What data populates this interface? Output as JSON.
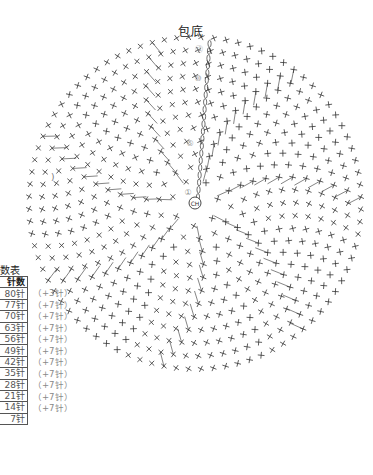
{
  "diagram": {
    "title": "包底",
    "type": "crochet round chart",
    "center_label": "CH",
    "row_markers": [
      "⑫",
      "⑩",
      "⑤",
      "①"
    ],
    "rounds": 12,
    "stray_text": ")"
  },
  "stitch_table": {
    "title": "数表",
    "header": "针数",
    "rows": [
      {
        "count": "80针",
        "increase": "（+3针）"
      },
      {
        "count": "77针",
        "increase": "（+7针）"
      },
      {
        "count": "70针",
        "increase": "（+7针）"
      },
      {
        "count": "63针",
        "increase": "（+7针）"
      },
      {
        "count": "56针",
        "increase": "（+7针）"
      },
      {
        "count": "49针",
        "increase": "（+7针）"
      },
      {
        "count": "42针",
        "increase": "（+7针）"
      },
      {
        "count": "35针",
        "increase": "（+7针）"
      },
      {
        "count": "28针",
        "increase": "（+7针）"
      },
      {
        "count": "21针",
        "increase": "（+7针）"
      },
      {
        "count": "14针",
        "increase": "（+7针）"
      },
      {
        "count": "7针",
        "increase": ""
      }
    ]
  },
  "colors": {
    "ink": "#333333",
    "marker": "#999999",
    "background": "#ffffff"
  }
}
